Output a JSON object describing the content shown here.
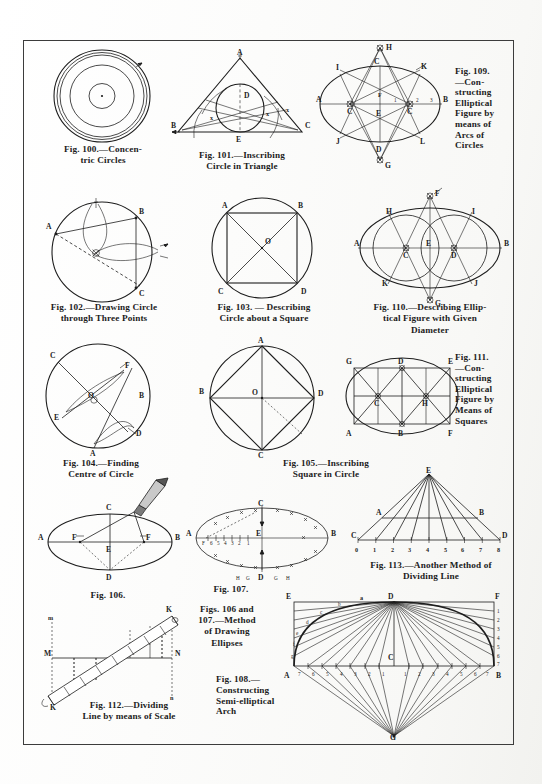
{
  "page": {
    "type": "scanned-book-plate",
    "background_color": "#fdfdfc",
    "ink_color": "#1d1d1d",
    "border": true
  },
  "figures": [
    {
      "id": "fig-100",
      "number": "100",
      "caption_lines": [
        "Fig. 100.—Concen-",
        "tric Circles"
      ],
      "caption_full": "Fig. 100.—Concentric Circles",
      "labels": [],
      "kind": "concentric-circles"
    },
    {
      "id": "fig-101",
      "number": "101",
      "caption_lines": [
        "Fig. 101.—Inscribing",
        "Circle in Triangle"
      ],
      "caption_full": "Fig. 101.—Inscribing Circle in Triangle",
      "labels": [
        "A",
        "B",
        "C",
        "D",
        "E"
      ],
      "kind": "incircle-triangle"
    },
    {
      "id": "fig-109",
      "number": "109",
      "caption_lines": [
        "Fig. 109.",
        "—Con-",
        "structing",
        "Elliptical",
        "Figure by",
        "means of",
        "Arcs of",
        "Circles"
      ],
      "caption_full": "Fig. 109.—Constructing Elliptical Figure by means of Arcs of Circles",
      "labels": [
        "H",
        "C",
        "K",
        "I",
        "J",
        "L",
        "D",
        "A",
        "B",
        "E",
        "F",
        "G"
      ],
      "ticks": [
        "1",
        "2",
        "3"
      ],
      "kind": "ellipse-arcs"
    },
    {
      "id": "fig-102",
      "number": "102",
      "caption_lines": [
        "Fig. 102.—Drawing Circle",
        "through Three Points"
      ],
      "caption_full": "Fig. 102.—Drawing Circle through Three Points",
      "labels": [
        "A",
        "B",
        "C"
      ],
      "kind": "circle-three-points"
    },
    {
      "id": "fig-103",
      "number": "103",
      "caption_lines": [
        "Fig. 103. — Describing",
        "Circle about a Square"
      ],
      "caption_full": "Fig. 103.—Describing Circle about a Square",
      "labels": [
        "A",
        "B",
        "C",
        "D",
        "O"
      ],
      "kind": "circumscribe-square"
    },
    {
      "id": "fig-110",
      "number": "110",
      "caption_lines": [
        "Fig. 110.—Describing Ellip-",
        "tical Figure with Given",
        "Diameter"
      ],
      "caption_full": "Fig. 110.—Describing Elliptical Figure with Given Diameter",
      "labels": [
        "F",
        "H",
        "I",
        "A",
        "B",
        "C",
        "D",
        "E",
        "K",
        "J",
        "G"
      ],
      "kind": "ellipse-given-diameter"
    },
    {
      "id": "fig-104",
      "number": "104",
      "caption_lines": [
        "Fig. 104.—Finding",
        "Centre of Circle"
      ],
      "caption_full": "Fig. 104.—Finding Centre of Circle",
      "labels": [
        "C",
        "F",
        "B",
        "E",
        "O",
        "A",
        "D"
      ],
      "kind": "find-centre"
    },
    {
      "id": "fig-105",
      "number": "105",
      "caption_lines": [
        "Fig. 105.—Inscribing",
        "Square in Circle"
      ],
      "caption_full": "Fig. 105.—Inscribing Square in Circle",
      "labels": [
        "A",
        "B",
        "C",
        "D",
        "O"
      ],
      "kind": "inscribe-square"
    },
    {
      "id": "fig-111",
      "number": "111",
      "caption_lines": [
        "Fig. 111.",
        "—Con-",
        "structing",
        "Elliptical",
        "Figure by",
        "Means of",
        "Squares"
      ],
      "caption_full": "Fig. 111.—Constructing Elliptical Figure by Means of Squares",
      "labels": [
        "D",
        "E",
        "C",
        "H",
        "A",
        "B",
        "F",
        "G"
      ],
      "kind": "ellipse-squares"
    },
    {
      "id": "fig-106",
      "number": "106",
      "caption_lines": [
        "Fig. 106."
      ],
      "caption_full": "Fig. 106.",
      "labels": [
        "A",
        "B",
        "C",
        "D",
        "E",
        "F",
        "F"
      ],
      "kind": "ellipse-string-pencil"
    },
    {
      "id": "fig-107",
      "number": "107",
      "caption_lines": [
        "Fig. 107."
      ],
      "caption_full": "Fig. 107.",
      "labels": [
        "A",
        "B",
        "C",
        "D",
        "E",
        "F",
        "G",
        "H"
      ],
      "ticks": [
        "6",
        "5",
        "4",
        "3",
        "2",
        "1"
      ],
      "kind": "ellipse-trammel"
    },
    {
      "id": "figs-106-107",
      "number": "106 and 107",
      "caption_lines": [
        "Figs. 106 and",
        "107.—Method",
        "of Drawing",
        "Ellipses"
      ],
      "caption_full": "Figs. 106 and 107.—Method of Drawing Ellipses",
      "kind": "shared-caption"
    },
    {
      "id": "fig-113",
      "number": "113",
      "caption_lines": [
        "Fig. 113.—Another Method of",
        "Dividing Line"
      ],
      "caption_full": "Fig. 113.—Another Method of Dividing Line",
      "labels": [
        "E",
        "A",
        "B",
        "C",
        "D"
      ],
      "ticks": [
        "0",
        "1",
        "2",
        "3",
        "4",
        "5",
        "6",
        "7",
        "8"
      ],
      "kind": "dividing-line-fan"
    },
    {
      "id": "fig-112",
      "number": "112",
      "caption_lines": [
        "Fig. 112.—Dividing",
        "Line by means of Scale"
      ],
      "caption_full": "Fig. 112.—Dividing Line by means of Scale",
      "labels": [
        "K",
        "K",
        "M",
        "N",
        "m",
        "n"
      ],
      "kind": "dividing-by-scale"
    },
    {
      "id": "fig-108",
      "number": "108",
      "caption_lines": [
        "Fig. 108.—",
        "Constructing",
        "Semi-elliptical",
        "Arch"
      ],
      "caption_full": "Fig. 108.—Constructing Semi-elliptical Arch",
      "labels": [
        "E",
        "D",
        "F",
        "A",
        "B",
        "C",
        "G",
        "a",
        "b",
        "c",
        "d",
        "e",
        "f",
        "g"
      ],
      "ticks_left": [
        "1",
        "2",
        "3",
        "4",
        "5",
        "6",
        "7"
      ],
      "ticks_right": [
        "1",
        "2",
        "3",
        "4",
        "5",
        "6",
        "7"
      ],
      "baseline_ticks_left": [
        "7",
        "6",
        "5",
        "4",
        "3",
        "2",
        "1"
      ],
      "baseline_ticks_right": [
        "1",
        "2",
        "3",
        "4",
        "5",
        "6",
        "7"
      ],
      "kind": "semi-elliptical-arch"
    }
  ]
}
